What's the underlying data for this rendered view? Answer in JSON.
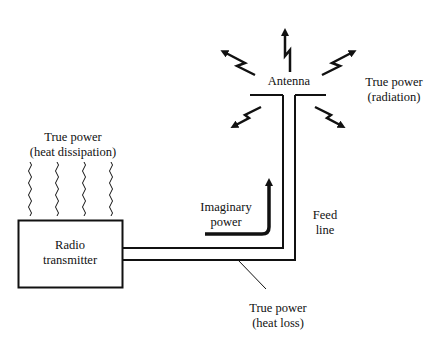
{
  "diagram": {
    "type": "power flow in radio transmitting system",
    "colors": {
      "ink": "#111111",
      "background": "#ffffff"
    },
    "labels": {
      "heat_dissipation": [
        "True power",
        "(heat dissipation)"
      ],
      "transmitter": [
        "Radio",
        "transmitter"
      ],
      "antenna": "Antenna",
      "radiation": [
        "True power",
        "(radiation)"
      ],
      "imaginary": [
        "Imaginary",
        "power"
      ],
      "feed_line": [
        "Feed",
        "line"
      ],
      "heat_loss": [
        "True power",
        "(heat loss)"
      ]
    },
    "nodes": [
      "Radio transmitter",
      "Feed line",
      "Antenna"
    ],
    "icons": [
      "wavy-heat-lines",
      "lightning-radiation-arrows",
      "curved-reflection-arrow"
    ]
  }
}
